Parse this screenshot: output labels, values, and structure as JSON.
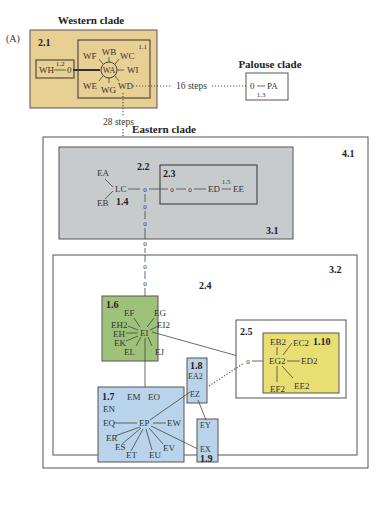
{
  "panel_label": "(A)",
  "colors": {
    "western_fill": "#e8cf94",
    "eastern_31_fill": "#c8cbce",
    "clade_16_fill": "#9fc27a",
    "clade_17_fill": "#b9d3ea",
    "clade_110_fill": "#e9de72",
    "line": "#444444"
  },
  "western": {
    "title": "Western clade",
    "clade_21": "2.1",
    "clade_11": "1.1",
    "clade_12_value": "1.2",
    "nodes": {
      "WH": "WH",
      "zero": "0",
      "WA": "WA",
      "WB": "WB",
      "WC": "WC",
      "WF": "WF",
      "WI": "WI",
      "WE": "WE",
      "WG": "WG",
      "WD": "WD"
    }
  },
  "palouse": {
    "title": "Palouse clade",
    "zero": "0",
    "PA": "PA",
    "clade_13": "1.3"
  },
  "connectors": {
    "west_palouse": "16 steps",
    "west_east": "28 steps"
  },
  "eastern": {
    "title": "Eastern clade",
    "clade_41": "4.1",
    "clade_31": "3.1",
    "clade_22": "2.2",
    "clade_23": "2.3",
    "clade_14": "1.4",
    "clade_15_value": "1.5",
    "nodes_31": {
      "EA": "EA",
      "EB": "EB",
      "LC": "LC",
      "ED": "ED",
      "EE": "EE",
      "zero": "0"
    },
    "clade_32": "3.2",
    "clade_24": "2.4",
    "clade_25": "2.5",
    "clade_16": "1.6",
    "nodes_16": {
      "EF": "EF",
      "EG": "EG",
      "EH2": "EH2",
      "EI2": "EI2",
      "EH": "EH",
      "EI": "EI",
      "EK": "EK",
      "EL": "EL",
      "EJ": "EJ"
    },
    "clade_17": "1.7",
    "nodes_17": {
      "EM": "EM",
      "EO": "EO",
      "EN": "EN",
      "EQ": "EQ",
      "EP": "EP",
      "EW": "EW",
      "ER": "ER",
      "ES": "ES",
      "ET": "ET",
      "EU": "EU",
      "EV": "EV"
    },
    "clade_18": "1.8",
    "nodes_18": {
      "EA2": "EA2",
      "EZ": "EZ"
    },
    "clade_19": "1.9",
    "nodes_19": {
      "EY": "EY",
      "EX": "EX"
    },
    "clade_110": "1.10",
    "nodes_110": {
      "EB2": "EB2",
      "EC2": "EC2",
      "EG2": "EG2",
      "ED2": "ED2",
      "EF2": "EF2",
      "EE2": "EE2"
    }
  }
}
